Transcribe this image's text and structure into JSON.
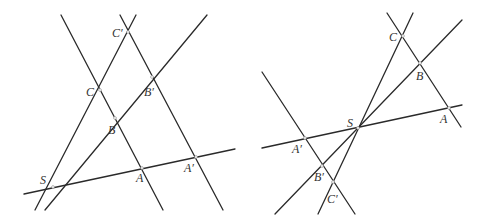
{
  "figures": [
    {
      "id": "left",
      "description": "Desargues configuration, triangles on same side of center S",
      "points": [
        {
          "label": "S",
          "x": 53,
          "y": 187,
          "lx": 40,
          "ly": 184
        },
        {
          "label": "A",
          "x": 142,
          "y": 168,
          "lx": 136,
          "ly": 182
        },
        {
          "label": "B",
          "x": 115,
          "y": 118,
          "lx": 108,
          "ly": 134
        },
        {
          "label": "C",
          "x": 100,
          "y": 90,
          "lx": 86,
          "ly": 96
        },
        {
          "label": "A′",
          "x": 196,
          "y": 157,
          "lx": 184,
          "ly": 172
        },
        {
          "label": "B′",
          "x": 152,
          "y": 77,
          "lx": 144,
          "ly": 96
        },
        {
          "label": "C′",
          "x": 128,
          "y": 32,
          "lx": 112,
          "ly": 37
        }
      ],
      "lines": [
        {
          "x1": 24,
          "y1": 194,
          "x2": 235,
          "y2": 149
        },
        {
          "x1": 45,
          "y1": 210,
          "x2": 207,
          "y2": 15
        },
        {
          "x1": 35,
          "y1": 210,
          "x2": 136,
          "y2": 15
        },
        {
          "x1": 61,
          "y1": 15,
          "x2": 163,
          "y2": 210
        },
        {
          "x1": 120,
          "y1": 15,
          "x2": 223,
          "y2": 210
        }
      ]
    },
    {
      "id": "right",
      "description": "Desargues configuration, triangles on opposite sides of center S",
      "points": [
        {
          "label": "S",
          "x": 358,
          "y": 128,
          "lx": 347,
          "ly": 127
        },
        {
          "label": "A",
          "x": 449,
          "y": 108,
          "lx": 440,
          "ly": 123
        },
        {
          "label": "B",
          "x": 420,
          "y": 63,
          "lx": 416,
          "ly": 80
        },
        {
          "label": "C",
          "x": 403,
          "y": 36,
          "lx": 389,
          "ly": 41
        },
        {
          "label": "A′",
          "x": 305,
          "y": 138,
          "lx": 292,
          "ly": 153
        },
        {
          "label": "B′",
          "x": 322,
          "y": 166,
          "lx": 314,
          "ly": 181
        },
        {
          "label": "C′",
          "x": 333,
          "y": 182,
          "lx": 327,
          "ly": 203
        }
      ],
      "lines": [
        {
          "x1": 262,
          "y1": 148,
          "x2": 462,
          "y2": 105
        },
        {
          "x1": 275,
          "y1": 214,
          "x2": 462,
          "y2": 20
        },
        {
          "x1": 318,
          "y1": 214,
          "x2": 413,
          "y2": 13
        },
        {
          "x1": 387,
          "y1": 13,
          "x2": 461,
          "y2": 127
        },
        {
          "x1": 262,
          "y1": 72,
          "x2": 355,
          "y2": 214
        }
      ]
    }
  ]
}
